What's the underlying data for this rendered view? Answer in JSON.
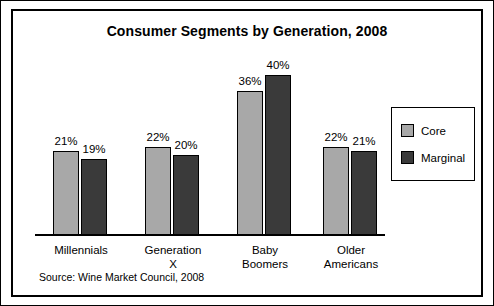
{
  "chart": {
    "title": "Consumer Segments by Generation, 2008",
    "source": "Source: Wine Market Council, 2008"
  },
  "legend": {
    "items": [
      {
        "label": "Core",
        "color": "#a8a8a8"
      },
      {
        "label": "Marginal",
        "color": "#3a3a3a"
      }
    ]
  },
  "chart_data": {
    "type": "bar",
    "title": "Consumer Segments by Generation, 2008",
    "xlabel": "",
    "ylabel": "",
    "ylim": [
      0,
      45
    ],
    "grid": false,
    "legend_position": "right",
    "categories": [
      "Millennials",
      "Generation X",
      "Baby Boomers",
      "Older Americans"
    ],
    "category_lines": [
      [
        "Millennials"
      ],
      [
        "Generation",
        "X"
      ],
      [
        "Baby",
        "Boomers"
      ],
      [
        "Older",
        "Americans"
      ]
    ],
    "series": [
      {
        "name": "Core",
        "values": [
          21,
          22,
          36,
          22
        ],
        "labels": [
          "21%",
          "22%",
          "36%",
          "22%"
        ],
        "color": "#a8a8a8"
      },
      {
        "name": "Marginal",
        "values": [
          19,
          20,
          40,
          21
        ],
        "labels": [
          "19%",
          "20%",
          "40%",
          "21%"
        ],
        "color": "#3a3a3a"
      }
    ],
    "annotations": [
      "Source: Wine Market Council, 2008"
    ]
  }
}
